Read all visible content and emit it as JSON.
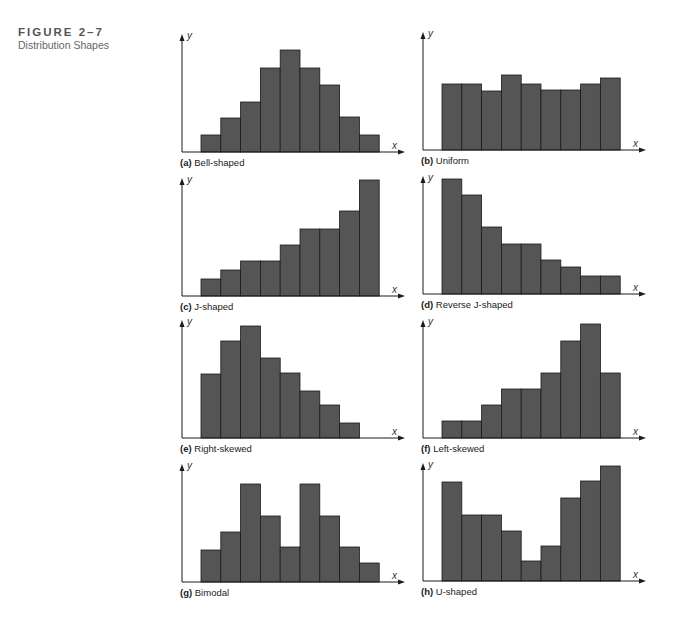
{
  "figure": {
    "number": "FIGURE 2–7",
    "title": "Distribution Shapes"
  },
  "chart_data": [
    {
      "id": "a",
      "type": "bar",
      "letter": "(a)",
      "title": "Bell-shaped",
      "xlabel": "x",
      "ylabel": "y",
      "categories": [
        1,
        2,
        3,
        4,
        5,
        6,
        7,
        8,
        9
      ],
      "values": [
        17,
        34,
        50,
        84,
        102,
        84,
        67,
        35,
        17
      ]
    },
    {
      "id": "b",
      "type": "bar",
      "letter": "(b)",
      "title": "Uniform",
      "xlabel": "x",
      "ylabel": "y",
      "categories": [
        1,
        2,
        3,
        4,
        5,
        6,
        7,
        8,
        9
      ],
      "values": [
        66,
        66,
        59,
        75,
        66,
        60,
        60,
        66,
        72
      ]
    },
    {
      "id": "c",
      "type": "bar",
      "letter": "(c)",
      "title": "J-shaped",
      "xlabel": "x",
      "ylabel": "y",
      "categories": [
        1,
        2,
        3,
        4,
        5,
        6,
        7,
        8,
        9
      ],
      "values": [
        17,
        26,
        35,
        35,
        51,
        67,
        67,
        85,
        116
      ]
    },
    {
      "id": "d",
      "type": "bar",
      "letter": "(d)",
      "title": "Reverse J-shaped",
      "xlabel": "x",
      "ylabel": "y",
      "categories": [
        1,
        2,
        3,
        4,
        5,
        6,
        7,
        8,
        9
      ],
      "values": [
        115,
        99,
        67,
        50,
        50,
        34,
        27,
        18,
        18
      ]
    },
    {
      "id": "e",
      "type": "bar",
      "letter": "(e)",
      "title": "Right-skewed",
      "xlabel": "x",
      "ylabel": "y",
      "categories": [
        1,
        2,
        3,
        4,
        5,
        6,
        7,
        8
      ],
      "values": [
        64,
        97,
        112,
        80,
        65,
        47,
        33,
        15
      ]
    },
    {
      "id": "f",
      "type": "bar",
      "letter": "(f)",
      "title": "Left-skewed",
      "xlabel": "x",
      "ylabel": "y",
      "categories": [
        1,
        2,
        3,
        4,
        5,
        6,
        7,
        8,
        9
      ],
      "values": [
        17,
        17,
        33,
        49,
        49,
        65,
        97,
        114,
        65
      ]
    },
    {
      "id": "g",
      "type": "bar",
      "letter": "(g)",
      "title": "Bimodal",
      "xlabel": "x",
      "ylabel": "y",
      "categories": [
        1,
        2,
        3,
        4,
        5,
        6,
        7,
        8,
        9
      ],
      "values": [
        32,
        50,
        98,
        66,
        35,
        98,
        66,
        35,
        19
      ]
    },
    {
      "id": "h",
      "type": "bar",
      "letter": "(h)",
      "title": "U-shaped",
      "xlabel": "x",
      "ylabel": "y",
      "categories": [
        1,
        2,
        3,
        4,
        5,
        6,
        7,
        8,
        9
      ],
      "values": [
        99,
        66,
        66,
        50,
        20,
        35,
        83,
        100,
        115
      ]
    }
  ],
  "colors": {
    "bar": "#555555",
    "axis": "#1a1a1a"
  }
}
